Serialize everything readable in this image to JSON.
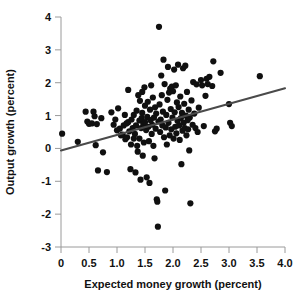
{
  "chart_data": {
    "type": "scatter",
    "title": "",
    "xlabel": "Expected money growth (percent)",
    "ylabel": "Output growth (percent)",
    "xlim": [
      0,
      4.0
    ],
    "ylim": [
      -3,
      4
    ],
    "xticks": [
      0,
      0.5,
      1.0,
      1.5,
      2.0,
      2.5,
      3.0,
      3.5,
      4.0
    ],
    "xticklabels": [
      "0",
      "0.5",
      "1.0",
      "1.5",
      "2.0",
      "2.5",
      "3.0",
      "3.5",
      "4.0"
    ],
    "yticks": [
      -3,
      -2,
      -1,
      0,
      1,
      2,
      3,
      4
    ],
    "yticklabels": [
      "-3",
      "-2",
      "-1",
      "0",
      "1",
      "2",
      "3",
      "4"
    ],
    "grid": false,
    "legend": null,
    "marker_color": "#101010",
    "marker_size": 3.1,
    "trendline": {
      "type": "linear-fit",
      "color": "#4a4a4a",
      "x_start": 0.0,
      "y_start": -0.06,
      "x_end": 4.0,
      "y_end": 1.83,
      "slope": 0.4725,
      "intercept": -0.06
    },
    "points": [
      [
        0.02,
        0.45
      ],
      [
        0.3,
        0.2
      ],
      [
        0.44,
        1.12
      ],
      [
        0.47,
        0.82
      ],
      [
        0.5,
        0.75
      ],
      [
        0.55,
        0.76
      ],
      [
        0.58,
        1.12
      ],
      [
        0.6,
        0.98
      ],
      [
        0.62,
        0.1
      ],
      [
        0.64,
        0.74
      ],
      [
        0.66,
        -0.67
      ],
      [
        0.72,
        0.92
      ],
      [
        0.75,
        -0.12
      ],
      [
        0.82,
        -0.72
      ],
      [
        0.9,
        1.1
      ],
      [
        0.94,
        0.72
      ],
      [
        0.97,
        0.88
      ],
      [
        1.0,
        0.55
      ],
      [
        1.02,
        1.22
      ],
      [
        1.05,
        0.6
      ],
      [
        1.07,
        0.4
      ],
      [
        1.1,
        0.42
      ],
      [
        1.12,
        0.7
      ],
      [
        1.14,
        1.02
      ],
      [
        1.15,
        0.28
      ],
      [
        1.17,
        0.76
      ],
      [
        1.18,
        0.34
      ],
      [
        1.2,
        1.78
      ],
      [
        1.2,
        0.8
      ],
      [
        1.22,
        0.52
      ],
      [
        1.24,
        -0.63
      ],
      [
        1.25,
        0.12
      ],
      [
        1.26,
        0.88
      ],
      [
        1.28,
        0.62
      ],
      [
        1.3,
        0.3
      ],
      [
        1.3,
        1.02
      ],
      [
        1.32,
        0.44
      ],
      [
        1.33,
        -0.73
      ],
      [
        1.34,
        0.7
      ],
      [
        1.35,
        1.15
      ],
      [
        1.36,
        0.08
      ],
      [
        1.37,
        -0.1
      ],
      [
        1.38,
        1.62
      ],
      [
        1.4,
        0.85
      ],
      [
        1.4,
        0.3
      ],
      [
        1.41,
        1.45
      ],
      [
        1.42,
        -0.95
      ],
      [
        1.43,
        0.62
      ],
      [
        1.44,
        0.92
      ],
      [
        1.45,
        1.72
      ],
      [
        1.45,
        1.08
      ],
      [
        1.46,
        -0.22
      ],
      [
        1.47,
        0.74
      ],
      [
        1.48,
        0.18
      ],
      [
        1.49,
        1.86
      ],
      [
        1.5,
        0.8
      ],
      [
        1.5,
        1.3
      ],
      [
        1.52,
        0.56
      ],
      [
        1.53,
        -0.88
      ],
      [
        1.54,
        0.96
      ],
      [
        1.55,
        1.42
      ],
      [
        1.56,
        0.66
      ],
      [
        1.57,
        0.22
      ],
      [
        1.58,
        -1.05
      ],
      [
        1.59,
        1.18
      ],
      [
        1.6,
        0.86
      ],
      [
        1.61,
        1.92
      ],
      [
        1.62,
        0.44
      ],
      [
        1.63,
        0.72
      ],
      [
        1.64,
        1.55
      ],
      [
        1.65,
        0.08
      ],
      [
        1.66,
        0.94
      ],
      [
        1.67,
        -0.3
      ],
      [
        1.68,
        1.25
      ],
      [
        1.69,
        0.6
      ],
      [
        1.7,
        1.06
      ],
      [
        1.71,
        -1.55
      ],
      [
        1.72,
        -1.62
      ],
      [
        1.73,
        -2.38
      ],
      [
        1.74,
        0.82
      ],
      [
        1.75,
        3.7
      ],
      [
        1.76,
        1.34
      ],
      [
        1.77,
        0.5
      ],
      [
        1.78,
        0.88
      ],
      [
        1.79,
        2.22
      ],
      [
        1.8,
        1.62
      ],
      [
        1.81,
        0.7
      ],
      [
        1.82,
        1.12
      ],
      [
        1.83,
        2.7
      ],
      [
        1.84,
        0.34
      ],
      [
        1.85,
        1.96
      ],
      [
        1.86,
        -1.28
      ],
      [
        1.87,
        0.64
      ],
      [
        1.88,
        1.02
      ],
      [
        1.89,
        0.12
      ],
      [
        1.9,
        1.48
      ],
      [
        1.91,
        2.48
      ],
      [
        1.92,
        0.78
      ],
      [
        1.93,
        1.7
      ],
      [
        1.94,
        0.4
      ],
      [
        1.95,
        1.82
      ],
      [
        1.96,
        1.2
      ],
      [
        1.97,
        0.58
      ],
      [
        1.98,
        1.88
      ],
      [
        1.99,
        0.94
      ],
      [
        2.0,
        1.74
      ],
      [
        2.01,
        0.3
      ],
      [
        2.02,
        2.4
      ],
      [
        2.03,
        1.1
      ],
      [
        2.04,
        0.66
      ],
      [
        2.05,
        1.92
      ],
      [
        2.06,
        0.46
      ],
      [
        2.07,
        1.4
      ],
      [
        2.08,
        0.84
      ],
      [
        2.09,
        2.55
      ],
      [
        2.1,
        1.26
      ],
      [
        2.11,
        0.7
      ],
      [
        2.12,
        0.26
      ],
      [
        2.13,
        1.58
      ],
      [
        2.14,
        0.92
      ],
      [
        2.15,
        -0.48
      ],
      [
        2.16,
        1.08
      ],
      [
        2.17,
        0.54
      ],
      [
        2.18,
        2.44
      ],
      [
        2.19,
        0.78
      ],
      [
        2.2,
        1.36
      ],
      [
        2.21,
        0.62
      ],
      [
        2.22,
        2.52
      ],
      [
        2.23,
        1.0
      ],
      [
        2.24,
        0.4
      ],
      [
        2.25,
        1.72
      ],
      [
        2.26,
        0.86
      ],
      [
        2.27,
        0.58
      ],
      [
        2.28,
        1.18
      ],
      [
        2.29,
        -0.06
      ],
      [
        2.3,
        0.94
      ],
      [
        2.31,
        -1.67
      ],
      [
        2.33,
        1.46
      ],
      [
        2.35,
        0.72
      ],
      [
        2.36,
        2.02
      ],
      [
        2.38,
        1.06
      ],
      [
        2.4,
        0.62
      ],
      [
        2.42,
        1.95
      ],
      [
        2.44,
        0.5
      ],
      [
        2.46,
        1.24
      ],
      [
        2.5,
        2.08
      ],
      [
        2.52,
        1.92
      ],
      [
        2.55,
        0.68
      ],
      [
        2.58,
        1.6
      ],
      [
        2.6,
        2.12
      ],
      [
        2.62,
        1.96
      ],
      [
        2.65,
        2.18
      ],
      [
        2.7,
        1.9
      ],
      [
        2.72,
        2.65
      ],
      [
        2.75,
        0.52
      ],
      [
        2.78,
        0.6
      ],
      [
        2.85,
        2.3
      ],
      [
        3.0,
        1.35
      ],
      [
        3.02,
        0.78
      ],
      [
        3.05,
        0.68
      ],
      [
        3.55,
        2.2
      ]
    ]
  }
}
